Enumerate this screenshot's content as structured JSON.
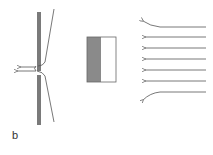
{
  "figure": {
    "panel_label": "b",
    "colors": {
      "rod": "#7a7a7a",
      "line": "#555555",
      "block_dark": "#8a8a8a",
      "block_light": "#ffffff",
      "block_border": "#666666"
    },
    "components": [
      {
        "name": "vertical-rod-with-orifice",
        "description": "Vertical plate with a small aperture and outgoing arrows"
      },
      {
        "name": "two-tone-block",
        "description": "Rectangular block, left half shaded, right half white"
      },
      {
        "name": "incoming-flow-arrows",
        "count": 7,
        "direction": "left"
      }
    ]
  }
}
